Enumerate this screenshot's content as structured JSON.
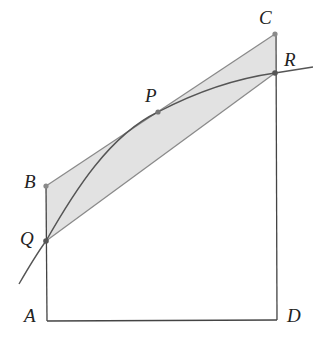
{
  "diagram": {
    "type": "geometry",
    "points": {
      "A": {
        "label": "A",
        "x": 47,
        "y": 321
      },
      "B": {
        "label": "B",
        "x": 46,
        "y": 186
      },
      "C": {
        "label": "C",
        "x": 275,
        "y": 34
      },
      "D": {
        "label": "D",
        "x": 277,
        "y": 320
      },
      "P": {
        "label": "P",
        "x": 158,
        "y": 112
      },
      "Q": {
        "label": "Q",
        "x": 46,
        "y": 241
      },
      "R": {
        "label": "R",
        "x": 275,
        "y": 73
      }
    },
    "colors": {
      "shade": "#e3e3e3",
      "line": "#333333",
      "gray_line": "#888888",
      "point": "#777777"
    }
  }
}
